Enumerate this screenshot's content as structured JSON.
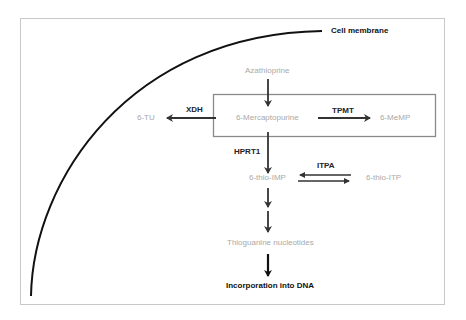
{
  "membrane": {
    "label": "Cell membrane"
  },
  "nodes": {
    "azathioprine": "Azathioprine",
    "mercaptopurine": "6-Mercaptopurine",
    "tu": "6-TU",
    "memp": "6-MeMP",
    "thio_imp": "6-thio-IMP",
    "thio_itp": "6-thio-ITP",
    "tgn": "Thioguanine nucleotides",
    "dna": "Incorporation into DNA"
  },
  "enzymes": {
    "xdh": "XDH",
    "tpmt": "TPMT",
    "hprt1": "HPRT1",
    "itpa": "ITPA"
  },
  "colors": {
    "frame": "#c8c8c8",
    "box": "#8a8a8a",
    "arrow": "#333333",
    "metabolite_text": "#a9a9a9",
    "enzyme_text": "#222222"
  }
}
